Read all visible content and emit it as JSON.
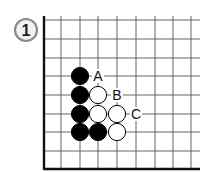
{
  "problem": {
    "number": "1",
    "badge_color": "#888888"
  },
  "board": {
    "grid_x": [
      61,
      80,
      98,
      117,
      136,
      155,
      173,
      191
    ],
    "grid_y": [
      20,
      39,
      58,
      76,
      95,
      114,
      132,
      151
    ],
    "left_edge_x": 44,
    "bottom_edge_y": 169,
    "top_y": 16,
    "right_x": 200,
    "stones": [
      {
        "color": "black",
        "x": 80,
        "y": 76
      },
      {
        "color": "black",
        "x": 80,
        "y": 95
      },
      {
        "color": "black",
        "x": 80,
        "y": 114
      },
      {
        "color": "black",
        "x": 80,
        "y": 132
      },
      {
        "color": "black",
        "x": 98,
        "y": 132
      },
      {
        "color": "white",
        "x": 98,
        "y": 95
      },
      {
        "color": "white",
        "x": 98,
        "y": 114
      },
      {
        "color": "white",
        "x": 117,
        "y": 114
      },
      {
        "color": "white",
        "x": 117,
        "y": 132
      }
    ],
    "labels": [
      {
        "text": "A",
        "x": 98,
        "y": 76
      },
      {
        "text": "B",
        "x": 117,
        "y": 95
      },
      {
        "text": "C",
        "x": 136,
        "y": 114
      }
    ]
  }
}
